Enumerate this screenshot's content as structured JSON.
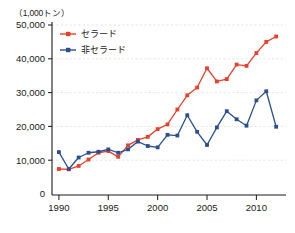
{
  "chart_data": {
    "type": "line",
    "title": "",
    "unit_label": "（1,000トン）",
    "xlabel": "",
    "ylabel": "",
    "xlim": [
      1989.3,
      2013.0
    ],
    "ylim": [
      0,
      52000
    ],
    "grid": true,
    "legend_position": "top-left-inside",
    "x": [
      1990,
      1991,
      1992,
      1993,
      1994,
      1995,
      1996,
      1997,
      1998,
      1999,
      2000,
      2001,
      2002,
      2003,
      2004,
      2005,
      2006,
      2007,
      2008,
      2009,
      2010,
      2011,
      2012
    ],
    "xticks": [
      1990,
      1995,
      2000,
      2005,
      2010
    ],
    "xtick_labels": [
      "1990",
      "1995",
      "2000",
      "2005",
      "2010"
    ],
    "yticks": [
      0,
      10000,
      20000,
      30000,
      40000,
      50000
    ],
    "ytick_labels": [
      "0",
      "10,000",
      "20,000",
      "30,000",
      "40,000",
      "50,000"
    ],
    "series": [
      {
        "name": "セラード",
        "color": "#e8412a",
        "marker": "square",
        "values": [
          7400,
          7300,
          8300,
          10200,
          12200,
          12700,
          11000,
          14400,
          16000,
          16900,
          19200,
          20600,
          25000,
          29200,
          31500,
          37200,
          33300,
          34000,
          38300,
          37900,
          41700,
          45000,
          46600
        ]
      },
      {
        "name": "非セラード",
        "color": "#2b4f8e",
        "marker": "square",
        "values": [
          12400,
          7400,
          10800,
          12200,
          12500,
          13200,
          12200,
          13200,
          15500,
          14200,
          13800,
          17500,
          17300,
          23300,
          18400,
          14500,
          19700,
          24500,
          22100,
          20200,
          27700,
          30400,
          19900
        ]
      }
    ]
  }
}
